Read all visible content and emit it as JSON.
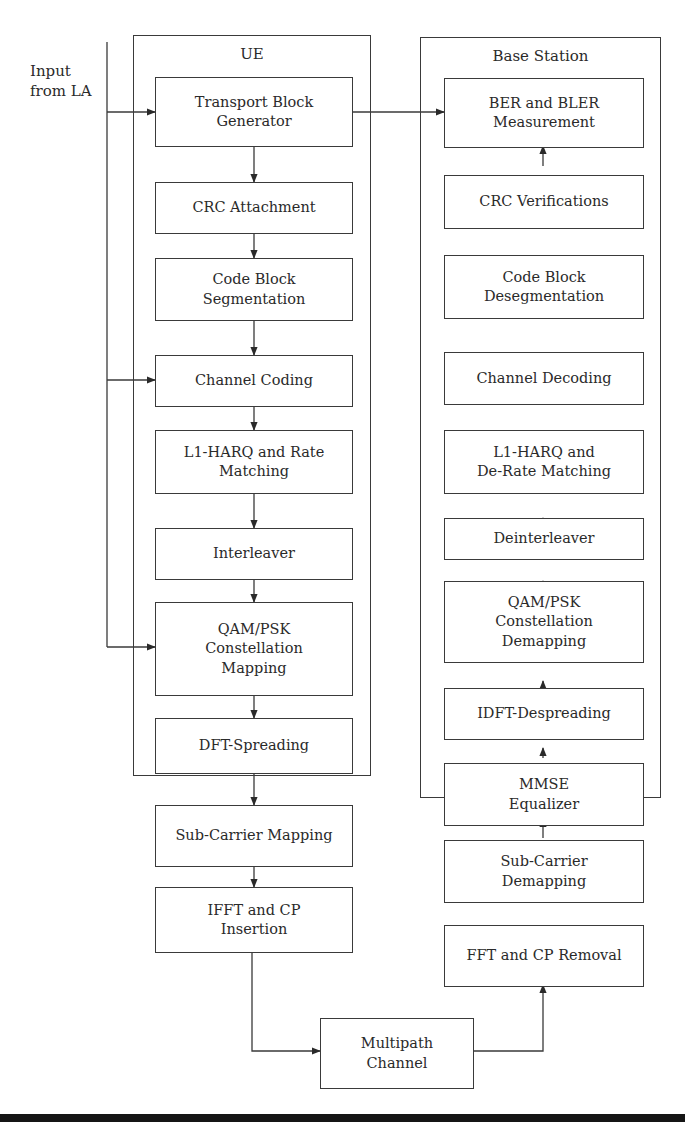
{
  "input_label": "Input\nfrom LA",
  "ue": {
    "title": "UE",
    "blocks": [
      "Transport Block\nGenerator",
      "CRC Attachment",
      "Code Block\nSegmentation",
      "Channel Coding",
      "L1-HARQ and Rate\nMatching",
      "Interleaver",
      "QAM/PSK\nConstellation\nMapping",
      "DFT-Spreading",
      "Sub-Carrier Mapping",
      "IFFT and CP\nInsertion"
    ]
  },
  "base_station": {
    "title": "Base Station",
    "blocks": [
      "BER and BLER\nMeasurement",
      "CRC Verifications",
      "Code Block\nDesegmentation",
      "Channel Decoding",
      "L1-HARQ and\nDe-Rate Matching",
      "Deinterleaver",
      "QAM/PSK\nConstellation\nDemapping",
      "IDFT-Despreading",
      "MMSE\nEqualizer",
      "Sub-Carrier\nDemapping",
      "FFT and CP Removal"
    ]
  },
  "channel": {
    "label": "Multipath\nChannel"
  },
  "colors": {
    "line": "#3a3a3a",
    "text": "#2a2a2a",
    "background": "#ffffff"
  }
}
